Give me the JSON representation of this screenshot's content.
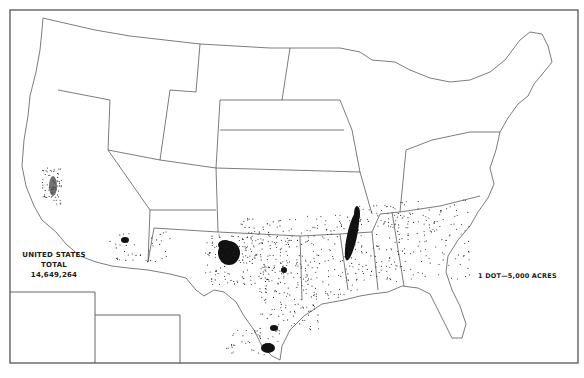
{
  "map": {
    "type": "dot-density",
    "region": "United States (conterminous) with Alaska and Hawaii insets",
    "total_label": "UNITED STATES",
    "total_sublabel": "TOTAL",
    "total_value": "14,649,264",
    "legend": "1 DOT=5,000 ACRES",
    "colors": {
      "ink": "#1a1a1a",
      "border": "#555555",
      "background": "#ffffff"
    }
  },
  "chart_data": {
    "type": "dot-density-map",
    "title": "",
    "total": 14649264,
    "dot_value_acres": 5000,
    "legend": "1 DOT—5,000 ACRES",
    "major_concentrations": [
      {
        "area": "Texas High Plains (Lubbock)",
        "density": "very high"
      },
      {
        "area": "Mississippi Delta (MS/AR/TN)",
        "density": "very high"
      },
      {
        "area": "Lower Rio Grande Valley, TX",
        "density": "very high"
      },
      {
        "area": "Texas Coastal Bend (Corpus Christi)",
        "density": "high"
      },
      {
        "area": "Central Texas Blackland Prairie",
        "density": "medium"
      },
      {
        "area": "San Joaquin Valley, CA",
        "density": "medium"
      },
      {
        "area": "Central Arizona",
        "density": "medium"
      },
      {
        "area": "Southwest Oklahoma",
        "density": "medium"
      },
      {
        "area": "Alabama / Georgia / Carolinas",
        "density": "low-medium"
      }
    ],
    "insets": [
      "Alaska",
      "Hawaii"
    ]
  }
}
